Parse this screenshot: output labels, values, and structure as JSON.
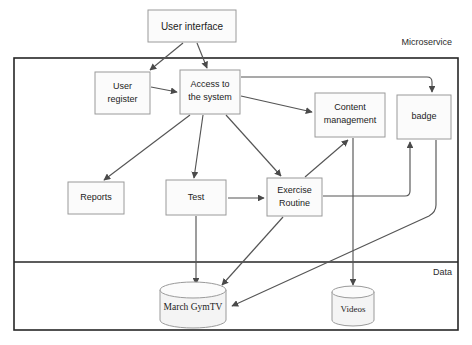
{
  "diagram": {
    "zones": [
      {
        "id": "microservice",
        "label": "Microservice"
      },
      {
        "id": "data",
        "label": "Data"
      }
    ],
    "nodes": [
      {
        "id": "user-interface",
        "label": "User interface",
        "shape": "rect",
        "x": 148,
        "y": 10,
        "w": 88,
        "h": 32
      },
      {
        "id": "user-register",
        "label": "User register",
        "line1": "User",
        "line2": "register",
        "shape": "rect",
        "x": 95,
        "y": 72,
        "w": 55,
        "h": 42
      },
      {
        "id": "access-to-system",
        "label": "Access to the system",
        "line1": "Access to",
        "line2": "the system",
        "shape": "rect",
        "x": 180,
        "y": 70,
        "w": 60,
        "h": 44
      },
      {
        "id": "content-management",
        "label": "Content management",
        "line1": "Content",
        "line2": "management",
        "shape": "rect",
        "x": 315,
        "y": 93,
        "w": 70,
        "h": 44
      },
      {
        "id": "badge",
        "label": "badge",
        "shape": "rect",
        "x": 397,
        "y": 95,
        "w": 54,
        "h": 44
      },
      {
        "id": "reports",
        "label": "Reports",
        "shape": "rect",
        "x": 68,
        "y": 182,
        "w": 56,
        "h": 32
      },
      {
        "id": "test",
        "label": "Test",
        "shape": "rect",
        "x": 166,
        "y": 180,
        "w": 60,
        "h": 35
      },
      {
        "id": "exercise-routine",
        "label": "Exercise Routine",
        "line1": "Exercise",
        "line2": "Routine",
        "shape": "rect",
        "x": 267,
        "y": 178,
        "w": 55,
        "h": 38
      },
      {
        "id": "march-gymtv",
        "label": "March GymTV",
        "shape": "cylinder",
        "cx": 193,
        "cy": 303,
        "rx": 33,
        "h": 30
      },
      {
        "id": "videos",
        "label": "Videos",
        "shape": "cylinder",
        "cx": 353,
        "cy": 305,
        "rx": 21,
        "h": 28
      }
    ],
    "edges": [
      {
        "from": "user-interface",
        "to": "user-register"
      },
      {
        "from": "user-interface",
        "to": "access-to-system"
      },
      {
        "from": "user-register",
        "to": "access-to-system"
      },
      {
        "from": "access-to-system",
        "to": "badge"
      },
      {
        "from": "access-to-system",
        "to": "content-management"
      },
      {
        "from": "access-to-system",
        "to": "reports"
      },
      {
        "from": "access-to-system",
        "to": "test"
      },
      {
        "from": "access-to-system",
        "to": "exercise-routine"
      },
      {
        "from": "test",
        "to": "exercise-routine"
      },
      {
        "from": "test",
        "to": "march-gymtv"
      },
      {
        "from": "exercise-routine",
        "to": "content-management"
      },
      {
        "from": "exercise-routine",
        "to": "march-gymtv"
      },
      {
        "from": "exercise-routine",
        "to": "badge"
      },
      {
        "from": "content-management",
        "to": "videos"
      },
      {
        "from": "badge",
        "to": "march-gymtv"
      }
    ],
    "colors": {
      "node_fill": "#fbfbfb",
      "node_stroke": "#9a9a9a",
      "frame_stroke": "#262626",
      "edge_stroke": "#555555",
      "text": "#1c1c1c",
      "background": "#ffffff"
    }
  }
}
